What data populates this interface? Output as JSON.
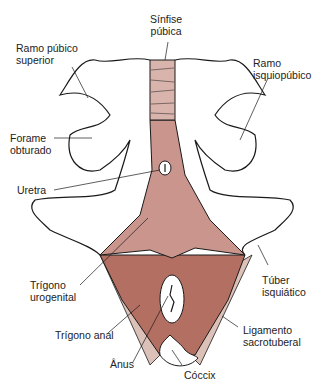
{
  "diagram": {
    "colors": {
      "urogenital": "#c9958c",
      "anal": "#b46f63",
      "ligament": "#dcc1b8",
      "symphysis": "#d8b4ad",
      "outline": "#1a1a1a",
      "bone": "#ffffff"
    },
    "labels": {
      "sinfise_publica": "Sínfise\npúbica",
      "ramo_pubico_superior": "Ramo púbico\nsuperior",
      "ramo_isquiopubico": "Ramo\nisquiopúbico",
      "forame_obturado": "Forame\nobturado",
      "uretra": "Uretra",
      "trigono_urogenital": "Trígono\nurogenital",
      "tuber_isquiatico": "Túber\nisquiático",
      "trigono_anal": "Trígono anal",
      "ligamento_sacrotuberal": "Ligamento\nsacrotuberal",
      "anus": "Ânus",
      "coccix": "Cóccix"
    }
  }
}
